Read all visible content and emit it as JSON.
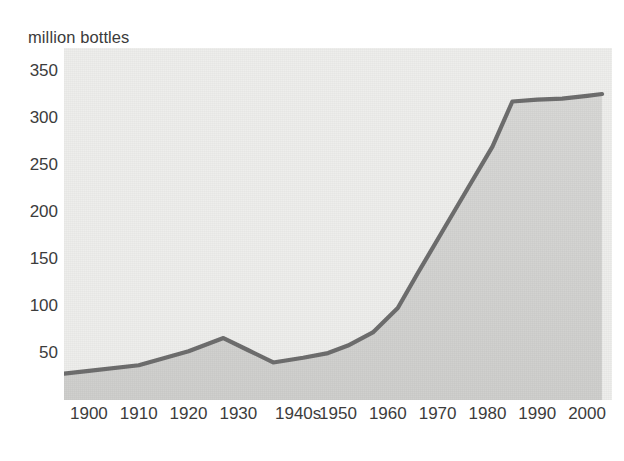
{
  "chart_data": {
    "type": "area",
    "title": "",
    "subtitle": "",
    "ylabel": "million bottles",
    "xlabel": "",
    "ylim": [
      0,
      375
    ],
    "xlim": [
      1895,
      2005
    ],
    "grid": false,
    "legend": null,
    "y_ticks": [
      350,
      300,
      250,
      200,
      150,
      100,
      50
    ],
    "x_ticks": [
      "1900",
      "1910",
      "1920",
      "1930",
      "1940s",
      "1950",
      "1960",
      "1970",
      "1980",
      "1990",
      "2000"
    ],
    "series": [
      {
        "name": "production",
        "x": [
          1895,
          1900,
          1910,
          1920,
          1927,
          1932,
          1937,
          1943,
          1948,
          1952,
          1957,
          1962,
          1966,
          1971,
          1976,
          1981,
          1985,
          1990,
          1995,
          2000,
          2003
        ],
        "values": [
          28,
          31,
          37,
          52,
          66,
          53,
          40,
          45,
          50,
          58,
          72,
          98,
          135,
          180,
          225,
          270,
          318,
          320,
          321,
          324,
          326
        ]
      }
    ],
    "annotations": [],
    "colors": {
      "line": "#6e6e6e",
      "fill": "#d4d4d2",
      "plot_background": "#eeeeec",
      "text": "#3c3c3c",
      "page_background": "#ffffff"
    },
    "notes": {
      "peak_year": "1927",
      "peak_value": 66,
      "trough_year": "1937",
      "trough_value": 40,
      "plateau_start_year": "1985",
      "plateau_value": 320
    }
  },
  "axis": {
    "y_title": "million bottles"
  }
}
